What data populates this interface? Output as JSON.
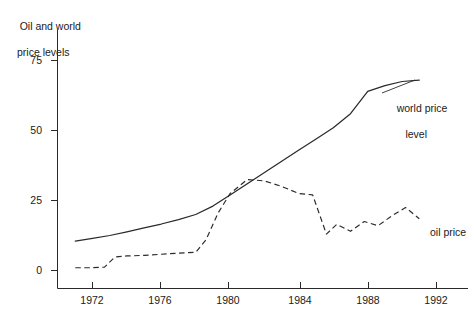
{
  "chart_data": {
    "type": "line",
    "title": "Oil and world price levels",
    "title_line1": "Oil and world",
    "title_line2": "price levels",
    "xlabel": "",
    "ylabel": "",
    "xlim": [
      1970.8,
      1992.3
    ],
    "ylim": [
      -2,
      82
    ],
    "grid": false,
    "legend_position": "right-inline",
    "x_ticks": [
      1972,
      1976,
      1980,
      1984,
      1988,
      1992
    ],
    "x_tick_labels": [
      "1972",
      "1976",
      "1980",
      "1984",
      "1988",
      "1992"
    ],
    "y_ticks": [
      0,
      25,
      50,
      75
    ],
    "y_tick_labels": [
      "0",
      "25",
      "50",
      "75"
    ],
    "series": [
      {
        "name": "world price level",
        "label": "world price level",
        "label_line1": "world price",
        "label_line2": "level",
        "style": "solid",
        "color": "#2a2a2a",
        "x": [
          1971.0,
          1972.0,
          1973.0,
          1974.0,
          1975.0,
          1976.0,
          1977.0,
          1978.0,
          1979.0,
          1980.0,
          1981.0,
          1982.0,
          1983.0,
          1984.0,
          1985.0,
          1986.0,
          1987.0,
          1988.0,
          1989.0,
          1990.0,
          1991.0
        ],
        "values": [
          10.5,
          11.5,
          12.5,
          13.8,
          15.2,
          16.6,
          18.2,
          20.0,
          23.0,
          27.0,
          31.0,
          35.0,
          39.0,
          43.0,
          47.0,
          51.0,
          56.0,
          64.0,
          66.0,
          67.5,
          68.0
        ]
      },
      {
        "name": "oil price",
        "label": "oil price",
        "style": "dashed",
        "color": "#2a2a2a",
        "x": [
          1971.0,
          1972.0,
          1972.7,
          1973.3,
          1974.0,
          1975.0,
          1976.0,
          1977.0,
          1978.0,
          1978.6,
          1979.3,
          1980.0,
          1981.0,
          1982.0,
          1983.0,
          1984.0,
          1984.8,
          1985.6,
          1986.2,
          1987.0,
          1987.8,
          1988.6,
          1989.4,
          1990.2,
          1991.0
        ],
        "values": [
          1.0,
          1.0,
          1.2,
          4.8,
          5.2,
          5.4,
          5.8,
          6.2,
          6.5,
          11.0,
          20.5,
          27.5,
          32.5,
          32.0,
          30.0,
          27.5,
          27.0,
          13.0,
          16.5,
          14.0,
          17.5,
          16.0,
          19.5,
          22.5,
          18.5
        ]
      }
    ]
  },
  "axes": {
    "y_axis_name": "y-axis",
    "x_axis_name": "x-axis"
  }
}
